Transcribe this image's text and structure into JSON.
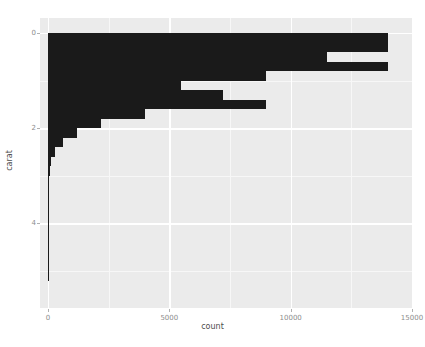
{
  "chart_data": {
    "type": "bar",
    "orientation": "horizontal",
    "title": "",
    "subtitle": "",
    "xlabel": "count",
    "ylabel": "carat",
    "xlim": [
      0,
      15000
    ],
    "ylim": [
      0,
      5.5
    ],
    "y_inverted": true,
    "grid": true,
    "legend": null,
    "bar_color": "#1a1a1a",
    "panel_color": "#ebebeb",
    "gridline_color": "#ffffff",
    "x_ticks": [
      0,
      5000,
      10000,
      15000
    ],
    "x_tick_labels": [
      "0",
      "5000",
      "10000",
      "15000"
    ],
    "y_ticks": [
      0,
      2,
      4
    ],
    "y_tick_labels": [
      "0",
      "2",
      "4"
    ],
    "x_minor_ticks": [
      2500,
      7500,
      12500
    ],
    "y_minor_ticks": [
      1,
      3,
      5
    ],
    "bin_width": 0.2,
    "categories": [
      0.2,
      0.4,
      0.6,
      0.8,
      1.0,
      1.2,
      1.4,
      1.6,
      1.8,
      2.0,
      2.2,
      2.4,
      2.6,
      2.8,
      3.0,
      3.2,
      3.4,
      3.6,
      3.8,
      4.0,
      4.2,
      4.4,
      4.6,
      4.8,
      5.0,
      5.2
    ],
    "values": [
      14000,
      14000,
      11500,
      14000,
      9000,
      5500,
      7200,
      9000,
      4000,
      2200,
      1200,
      600,
      300,
      140,
      80,
      40,
      20,
      12,
      8,
      5,
      3,
      2,
      1,
      1,
      1,
      1
    ]
  }
}
